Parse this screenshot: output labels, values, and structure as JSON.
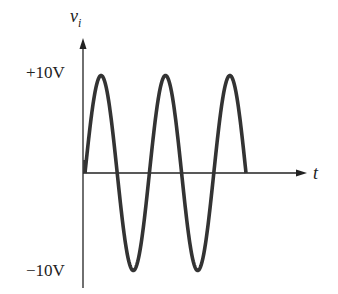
{
  "chart_data": {
    "type": "line",
    "title": "",
    "xlabel": "t",
    "ylabel": "v_i",
    "ylabel_main": "v",
    "ylabel_sub": "i",
    "ytick_labels": [
      "+10V",
      "-10V"
    ],
    "yticks": [
      10,
      -10
    ],
    "ylim": [
      -10,
      10
    ],
    "series": [
      {
        "name": "v_i",
        "description": "Sinusoid starting at 0 at t=0, amplitude 10V, 2.5 cycles, ending at 0",
        "amplitude": 10,
        "cycles": 2.5,
        "x": [
          0,
          0.25,
          0.5,
          0.75,
          1.0,
          1.25,
          1.5,
          1.75,
          2.0,
          2.25,
          2.5
        ],
        "values": [
          0,
          10,
          0,
          -10,
          0,
          10,
          0,
          -10,
          0,
          10,
          0
        ]
      }
    ],
    "grid": false,
    "legend": false
  },
  "labels": {
    "y_axis_main": "v",
    "y_axis_sub": "i",
    "x_axis": "t",
    "pos_peak": "+10V",
    "neg_peak": "−10V"
  },
  "colors": {
    "axis": "#222222",
    "waveform": "#333333",
    "background": "#ffffff"
  }
}
